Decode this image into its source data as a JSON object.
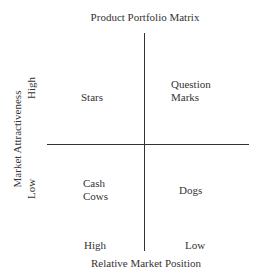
{
  "title": "Product Portfolio Matrix",
  "quadrants": {
    "top_left": "Stars",
    "top_right_line1": "Question",
    "top_right_line2": "Marks",
    "bottom_left_line1": "Cash",
    "bottom_left_line2": "Cows",
    "bottom_right": "Dogs"
  },
  "x_axis": {
    "label": "Relative Market Position",
    "left_tick": "High",
    "right_tick": "Low"
  },
  "y_axis": {
    "label": "Market Attractiveness",
    "top_tick": "High",
    "bottom_tick": "Low"
  },
  "colors": {
    "line": "#333333",
    "text": "#333333",
    "background": "#ffffff"
  }
}
